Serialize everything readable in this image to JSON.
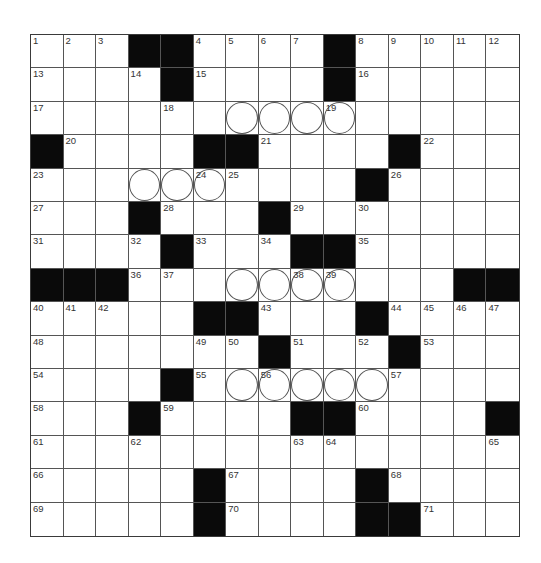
{
  "puzzle": {
    "rows": 15,
    "cols": 15,
    "colors": {
      "block": "#0a0a0a",
      "cell": "#ffffff",
      "line": "#555555",
      "number": "#333333"
    },
    "layout": [
      "...##....#.....",
      "....#....#.....",
      "...............",
      "#....##....#...",
      "..........#....",
      "...#...#.......",
      "....#...##.....",
      "###..........###",
      ".....##...#....",
      ".......#...#...",
      "....#..........",
      "...#....##....#",
      "...............",
      ".....#....#....",
      ".....#....##..."
    ],
    "circles": [
      [
        3,
        7
      ],
      [
        3,
        8
      ],
      [
        3,
        9
      ],
      [
        3,
        10
      ],
      [
        5,
        4
      ],
      [
        5,
        5
      ],
      [
        5,
        6
      ],
      [
        8,
        7
      ],
      [
        8,
        8
      ],
      [
        8,
        9
      ],
      [
        8,
        10
      ],
      [
        11,
        7
      ],
      [
        11,
        8
      ],
      [
        11,
        9
      ],
      [
        11,
        10
      ],
      [
        11,
        11
      ]
    ],
    "numbers": [
      {
        "r": 1,
        "c": 1,
        "n": "1"
      },
      {
        "r": 1,
        "c": 2,
        "n": "2"
      },
      {
        "r": 1,
        "c": 3,
        "n": "3"
      },
      {
        "r": 1,
        "c": 6,
        "n": "4"
      },
      {
        "r": 1,
        "c": 7,
        "n": "5"
      },
      {
        "r": 1,
        "c": 8,
        "n": "6"
      },
      {
        "r": 1,
        "c": 9,
        "n": "7"
      },
      {
        "r": 1,
        "c": 11,
        "n": "8"
      },
      {
        "r": 1,
        "c": 12,
        "n": "9"
      },
      {
        "r": 1,
        "c": 13,
        "n": "10"
      },
      {
        "r": 1,
        "c": 14,
        "n": "11"
      },
      {
        "r": 1,
        "c": 15,
        "n": "12"
      },
      {
        "r": 2,
        "c": 1,
        "n": "13"
      },
      {
        "r": 2,
        "c": 4,
        "n": "14"
      },
      {
        "r": 2,
        "c": 6,
        "n": "15"
      },
      {
        "r": 2,
        "c": 11,
        "n": "16"
      },
      {
        "r": 3,
        "c": 1,
        "n": "17"
      },
      {
        "r": 3,
        "c": 5,
        "n": "18"
      },
      {
        "r": 3,
        "c": 10,
        "n": "19"
      },
      {
        "r": 4,
        "c": 2,
        "n": "20"
      },
      {
        "r": 4,
        "c": 8,
        "n": "21"
      },
      {
        "r": 4,
        "c": 13,
        "n": "22"
      },
      {
        "r": 5,
        "c": 1,
        "n": "23"
      },
      {
        "r": 5,
        "c": 6,
        "n": "24"
      },
      {
        "r": 5,
        "c": 7,
        "n": "25"
      },
      {
        "r": 5,
        "c": 12,
        "n": "26"
      },
      {
        "r": 6,
        "c": 1,
        "n": "27"
      },
      {
        "r": 6,
        "c": 5,
        "n": "28"
      },
      {
        "r": 6,
        "c": 9,
        "n": "29"
      },
      {
        "r": 6,
        "c": 11,
        "n": "30"
      },
      {
        "r": 7,
        "c": 1,
        "n": "31"
      },
      {
        "r": 7,
        "c": 4,
        "n": "32"
      },
      {
        "r": 7,
        "c": 6,
        "n": "33"
      },
      {
        "r": 7,
        "c": 8,
        "n": "34"
      },
      {
        "r": 7,
        "c": 11,
        "n": "35"
      },
      {
        "r": 8,
        "c": 4,
        "n": "36"
      },
      {
        "r": 8,
        "c": 5,
        "n": "37"
      },
      {
        "r": 8,
        "c": 9,
        "n": "38"
      },
      {
        "r": 8,
        "c": 10,
        "n": "39"
      },
      {
        "r": 9,
        "c": 1,
        "n": "40"
      },
      {
        "r": 9,
        "c": 2,
        "n": "41"
      },
      {
        "r": 9,
        "c": 3,
        "n": "42"
      },
      {
        "r": 9,
        "c": 8,
        "n": "43"
      },
      {
        "r": 9,
        "c": 12,
        "n": "44"
      },
      {
        "r": 9,
        "c": 13,
        "n": "45"
      },
      {
        "r": 9,
        "c": 14,
        "n": "46"
      },
      {
        "r": 9,
        "c": 15,
        "n": "47"
      },
      {
        "r": 10,
        "c": 1,
        "n": "48"
      },
      {
        "r": 10,
        "c": 6,
        "n": "49"
      },
      {
        "r": 10,
        "c": 7,
        "n": "50"
      },
      {
        "r": 10,
        "c": 9,
        "n": "51"
      },
      {
        "r": 10,
        "c": 11,
        "n": "52"
      },
      {
        "r": 10,
        "c": 13,
        "n": "53"
      },
      {
        "r": 11,
        "c": 1,
        "n": "54"
      },
      {
        "r": 11,
        "c": 6,
        "n": "55"
      },
      {
        "r": 11,
        "c": 8,
        "n": "56"
      },
      {
        "r": 11,
        "c": 12,
        "n": "57"
      },
      {
        "r": 12,
        "c": 1,
        "n": "58"
      },
      {
        "r": 12,
        "c": 5,
        "n": "59"
      },
      {
        "r": 12,
        "c": 11,
        "n": "60"
      },
      {
        "r": 13,
        "c": 1,
        "n": "61"
      },
      {
        "r": 13,
        "c": 4,
        "n": "62"
      },
      {
        "r": 13,
        "c": 9,
        "n": "63"
      },
      {
        "r": 13,
        "c": 10,
        "n": "64"
      },
      {
        "r": 13,
        "c": 15,
        "n": "65"
      },
      {
        "r": 14,
        "c": 1,
        "n": "66"
      },
      {
        "r": 14,
        "c": 7,
        "n": "67"
      },
      {
        "r": 14,
        "c": 12,
        "n": "68"
      },
      {
        "r": 15,
        "c": 1,
        "n": "69"
      },
      {
        "r": 15,
        "c": 7,
        "n": "70"
      },
      {
        "r": 15,
        "c": 13,
        "n": "71"
      }
    ],
    "entries": {}
  }
}
